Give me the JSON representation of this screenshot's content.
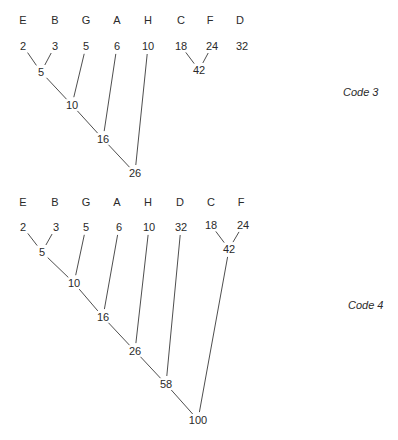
{
  "diagrams": [
    {
      "caption": "Code 3",
      "caption_pos": [
        343,
        96
      ],
      "symbols": [
        {
          "label": "E",
          "x": 23,
          "y": 24
        },
        {
          "label": "B",
          "x": 55,
          "y": 24
        },
        {
          "label": "G",
          "x": 86,
          "y": 24
        },
        {
          "label": "A",
          "x": 117,
          "y": 24
        },
        {
          "label": "H",
          "x": 148,
          "y": 24
        },
        {
          "label": "C",
          "x": 181,
          "y": 24
        },
        {
          "label": "F",
          "x": 210,
          "y": 24
        },
        {
          "label": "D",
          "x": 240,
          "y": 24
        }
      ],
      "nodes": [
        {
          "id": "e",
          "value": "2",
          "x": 23,
          "y": 50
        },
        {
          "id": "b",
          "value": "3",
          "x": 55,
          "y": 50
        },
        {
          "id": "g",
          "value": "5",
          "x": 86,
          "y": 50
        },
        {
          "id": "a",
          "value": "6",
          "x": 117,
          "y": 50
        },
        {
          "id": "h",
          "value": "10",
          "x": 148,
          "y": 50
        },
        {
          "id": "c",
          "value": "18",
          "x": 181,
          "y": 50
        },
        {
          "id": "f",
          "value": "24",
          "x": 212,
          "y": 50
        },
        {
          "id": "d",
          "value": "32",
          "x": 242,
          "y": 50
        },
        {
          "id": "n5",
          "value": "5",
          "x": 41,
          "y": 76
        },
        {
          "id": "n10",
          "value": "10",
          "x": 72,
          "y": 109
        },
        {
          "id": "n16",
          "value": "16",
          "x": 103,
          "y": 143
        },
        {
          "id": "n26",
          "value": "26",
          "x": 135,
          "y": 177
        },
        {
          "id": "n42",
          "value": "42",
          "x": 199,
          "y": 74
        }
      ],
      "edges": [
        [
          "e",
          "n5"
        ],
        [
          "b",
          "n5"
        ],
        [
          "n5",
          "n10"
        ],
        [
          "g",
          "n10"
        ],
        [
          "n10",
          "n16"
        ],
        [
          "a",
          "n16"
        ],
        [
          "n16",
          "n26"
        ],
        [
          "h",
          "n26"
        ],
        [
          "c",
          "n42"
        ],
        [
          "f",
          "n42"
        ]
      ]
    },
    {
      "caption": "Code 4",
      "caption_pos": [
        348,
        309
      ],
      "symbols": [
        {
          "label": "E",
          "x": 23,
          "y": 206
        },
        {
          "label": "B",
          "x": 55,
          "y": 206
        },
        {
          "label": "G",
          "x": 86,
          "y": 206
        },
        {
          "label": "A",
          "x": 117,
          "y": 206
        },
        {
          "label": "H",
          "x": 148,
          "y": 206
        },
        {
          "label": "D",
          "x": 180,
          "y": 206
        },
        {
          "label": "C",
          "x": 211,
          "y": 206
        },
        {
          "label": "F",
          "x": 241,
          "y": 206
        }
      ],
      "nodes": [
        {
          "id": "e",
          "value": "2",
          "x": 23,
          "y": 231
        },
        {
          "id": "b",
          "value": "3",
          "x": 56,
          "y": 231
        },
        {
          "id": "g",
          "value": "5",
          "x": 86,
          "y": 231
        },
        {
          "id": "a",
          "value": "6",
          "x": 119,
          "y": 231
        },
        {
          "id": "h",
          "value": "10",
          "x": 149,
          "y": 231
        },
        {
          "id": "d",
          "value": "32",
          "x": 181,
          "y": 231
        },
        {
          "id": "c",
          "value": "18",
          "x": 211,
          "y": 229
        },
        {
          "id": "f",
          "value": "24",
          "x": 243,
          "y": 229
        },
        {
          "id": "n5",
          "value": "5",
          "x": 42,
          "y": 256
        },
        {
          "id": "n10",
          "value": "10",
          "x": 74,
          "y": 287
        },
        {
          "id": "n16",
          "value": "16",
          "x": 103,
          "y": 321
        },
        {
          "id": "n26",
          "value": "26",
          "x": 135,
          "y": 355
        },
        {
          "id": "n58",
          "value": "58",
          "x": 166,
          "y": 388
        },
        {
          "id": "n42",
          "value": "42",
          "x": 229,
          "y": 253
        },
        {
          "id": "n100",
          "value": "100",
          "x": 198,
          "y": 424
        }
      ],
      "edges": [
        [
          "e",
          "n5"
        ],
        [
          "b",
          "n5"
        ],
        [
          "n5",
          "n10"
        ],
        [
          "g",
          "n10"
        ],
        [
          "n10",
          "n16"
        ],
        [
          "a",
          "n16"
        ],
        [
          "n16",
          "n26"
        ],
        [
          "h",
          "n26"
        ],
        [
          "n26",
          "n58"
        ],
        [
          "d",
          "n58"
        ],
        [
          "c",
          "n42"
        ],
        [
          "f",
          "n42"
        ],
        [
          "n58",
          "n100"
        ],
        [
          "n42",
          "n100"
        ]
      ]
    }
  ]
}
